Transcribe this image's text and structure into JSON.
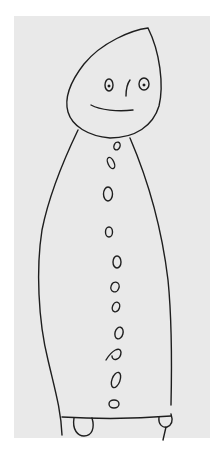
{
  "image": {
    "subject": "child's pencil drawing of a figure",
    "description": "Tall figure with teardrop-shaped head, two eyes, nose and smile, long tapered body with a column of buttons, two small feet",
    "colors": {
      "background": "#ffffff",
      "paper": "#e9e9e9",
      "ink": "#1e1e1e"
    },
    "features": {
      "head": "teardrop",
      "eyes": 2,
      "nose": 1,
      "mouth": "smile",
      "buttons": 12,
      "feet": 2
    }
  }
}
